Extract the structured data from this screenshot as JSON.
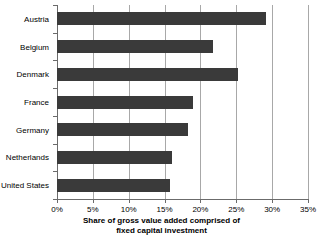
{
  "chart_data": {
    "type": "bar",
    "orientation": "horizontal",
    "title": "",
    "xlabel": "Share of gross value added comprised of fixed capital investment",
    "ylabel": "",
    "categories": [
      "Austria",
      "Belgium",
      "Denmark",
      "France",
      "Germany",
      "Netherlands",
      "United States"
    ],
    "values": [
      29.2,
      21.7,
      25.3,
      19.0,
      18.2,
      16.1,
      15.8
    ],
    "unit": "%",
    "xlim": [
      0,
      35
    ],
    "xticks": [
      0,
      5,
      10,
      15,
      20,
      25,
      30,
      35
    ],
    "xticklabels": [
      "0%",
      "5%",
      "10%",
      "15%",
      "20%",
      "25%",
      "30%",
      "35%"
    ],
    "grid": "vertical",
    "legend": "none",
    "bar_color": "#3a3a3a",
    "gridline_color": "#a8a8a8",
    "axis_color": "#6b6b6b",
    "background": "#ffffff"
  },
  "axis_title": {
    "line1": "Share of gross value added comprised of",
    "line2": "fixed capital investment"
  }
}
